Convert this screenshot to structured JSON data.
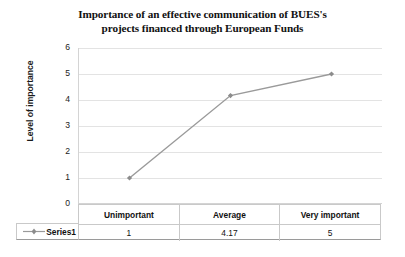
{
  "chart_data": {
    "type": "line",
    "title": "Importance of an effective communication of BUES's projects financed through European Funds",
    "title_line_1": "Importance of an effective communication of BUES's",
    "title_line_2": "projects financed through European Funds",
    "xlabel": "",
    "ylabel": "Level of importance",
    "ylim": [
      0,
      6
    ],
    "y_ticks": [
      "6",
      "5",
      "4",
      "3",
      "2",
      "1",
      "0"
    ],
    "y_tick_values": [
      6,
      5,
      4,
      3,
      2,
      1,
      0
    ],
    "categories": [
      "Unimportant",
      "Average",
      "Very important"
    ],
    "series": [
      {
        "name": "Series1",
        "values": [
          1,
          4.17,
          5
        ],
        "value_labels": [
          "1",
          "4.17",
          "5"
        ],
        "line_color": "#9a9a9a",
        "marker_color": "#8c8c8c",
        "marker": "diamond"
      }
    ],
    "grid": true,
    "legend_position": "data-table-left",
    "data_table_visible": true,
    "gridline_color": "#e3e3e3",
    "axis_color": "#d4d4d4"
  },
  "table": {
    "header": [
      "Unimportant",
      "Average",
      "Very important"
    ],
    "row_label": "Series1",
    "row_values": [
      "1",
      "4.17",
      "5"
    ]
  }
}
